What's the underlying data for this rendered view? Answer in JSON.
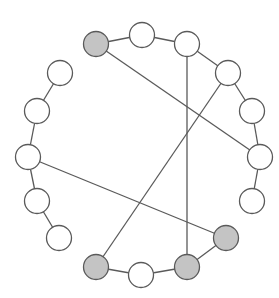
{
  "diagram": {
    "type": "circular-graph",
    "colors": {
      "background": "#ffffff",
      "node_fill": "#ffffff",
      "node_highlight_fill": "#c4c4c4",
      "stroke": "#5a5a5a"
    },
    "node_radius": 12.5,
    "nodes": [
      {
        "id": 0,
        "x": 96,
        "y": 44,
        "highlighted": true
      },
      {
        "id": 1,
        "x": 142,
        "y": 35,
        "highlighted": false
      },
      {
        "id": 2,
        "x": 187,
        "y": 44,
        "highlighted": false
      },
      {
        "id": 3,
        "x": 228,
        "y": 73,
        "highlighted": false
      },
      {
        "id": 4,
        "x": 252,
        "y": 111,
        "highlighted": false
      },
      {
        "id": 5,
        "x": 260,
        "y": 157,
        "highlighted": false
      },
      {
        "id": 6,
        "x": 252,
        "y": 201,
        "highlighted": false
      },
      {
        "id": 7,
        "x": 226,
        "y": 238,
        "highlighted": true
      },
      {
        "id": 8,
        "x": 187,
        "y": 267,
        "highlighted": true
      },
      {
        "id": 9,
        "x": 141,
        "y": 275,
        "highlighted": false
      },
      {
        "id": 10,
        "x": 96,
        "y": 267,
        "highlighted": true
      },
      {
        "id": 11,
        "x": 59,
        "y": 238,
        "highlighted": false
      },
      {
        "id": 12,
        "x": 37,
        "y": 201,
        "highlighted": false
      },
      {
        "id": 13,
        "x": 28,
        "y": 157,
        "highlighted": false
      },
      {
        "id": 14,
        "x": 37,
        "y": 111,
        "highlighted": false
      },
      {
        "id": 15,
        "x": 60,
        "y": 73,
        "highlighted": false
      }
    ],
    "ring_edges": [
      [
        0,
        1
      ],
      [
        1,
        2
      ],
      [
        2,
        3
      ],
      [
        3,
        4
      ],
      [
        4,
        5
      ],
      [
        5,
        6
      ],
      [
        7,
        8
      ],
      [
        8,
        9
      ],
      [
        9,
        10
      ],
      [
        11,
        12
      ],
      [
        12,
        13
      ],
      [
        13,
        14
      ],
      [
        14,
        15
      ]
    ],
    "chord_edges": [
      [
        0,
        5
      ],
      [
        2,
        8
      ],
      [
        3,
        10
      ],
      [
        13,
        7
      ]
    ]
  }
}
